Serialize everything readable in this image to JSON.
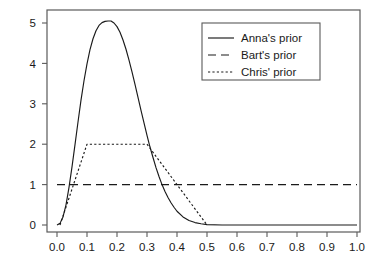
{
  "chart_data": {
    "type": "line",
    "title": "",
    "subtitle": "",
    "xlabel": "",
    "ylabel": "",
    "xlim": [
      0.0,
      1.0
    ],
    "ylim": [
      0.0,
      5.3
    ],
    "grid": false,
    "legend_position": "top-right",
    "x_tick_labels": [
      "0.0",
      "0.1",
      "0.2",
      "0.3",
      "0.4",
      "0.5",
      "0.6",
      "0.7",
      "0.8",
      "0.9",
      "1.0"
    ],
    "x_tick_values": [
      0.0,
      0.1,
      0.2,
      0.3,
      0.4,
      0.5,
      0.6,
      0.7,
      0.8,
      0.9,
      1.0
    ],
    "y_tick_labels": [
      "0",
      "1",
      "2",
      "3",
      "4",
      "5"
    ],
    "y_tick_values": [
      0,
      1,
      2,
      3,
      4,
      5
    ],
    "series": [
      {
        "name": "Anna's prior",
        "style": "solid",
        "color": "#1a1a1a",
        "x": [
          0.0,
          0.01,
          0.02,
          0.03,
          0.04,
          0.05,
          0.06,
          0.07,
          0.08,
          0.09,
          0.1,
          0.11,
          0.12,
          0.13,
          0.14,
          0.15,
          0.16,
          0.17,
          0.18,
          0.19,
          0.2,
          0.21,
          0.22,
          0.23,
          0.24,
          0.25,
          0.26,
          0.27,
          0.28,
          0.29,
          0.3,
          0.31,
          0.32,
          0.33,
          0.34,
          0.35,
          0.36,
          0.37,
          0.38,
          0.39,
          0.4,
          0.42,
          0.44,
          0.46,
          0.48,
          0.5,
          0.55,
          0.6,
          0.7,
          0.8,
          0.9,
          1.0
        ],
        "y": [
          0.0,
          0.04,
          0.2,
          0.5,
          0.93,
          1.44,
          1.99,
          2.55,
          3.09,
          3.57,
          3.99,
          4.34,
          4.61,
          4.81,
          4.94,
          5.01,
          5.04,
          5.05,
          5.05,
          5.0,
          4.91,
          4.77,
          4.58,
          4.35,
          4.08,
          3.79,
          3.48,
          3.16,
          2.84,
          2.53,
          2.22,
          1.93,
          1.67,
          1.42,
          1.2,
          1.0,
          0.83,
          0.68,
          0.55,
          0.44,
          0.34,
          0.2,
          0.11,
          0.06,
          0.03,
          0.01,
          0.0,
          0.0,
          0.0,
          0.0,
          0.0,
          0.0
        ]
      },
      {
        "name": "Bart's prior",
        "style": "dashed",
        "color": "#1a1a1a",
        "x": [
          0.0,
          1.0
        ],
        "y": [
          1.0,
          1.0
        ]
      },
      {
        "name": "Chris' prior",
        "style": "dotted",
        "color": "#1a1a1a",
        "x": [
          0.01,
          0.1,
          0.3,
          0.5
        ],
        "y": [
          0.0,
          2.0,
          2.0,
          0.0
        ]
      }
    ]
  },
  "legend": {
    "entries": [
      {
        "label": "Anna's prior",
        "style": "solid"
      },
      {
        "label": "Bart's prior",
        "style": "dashed"
      },
      {
        "label": "Chris' prior",
        "style": "dotted"
      }
    ]
  }
}
